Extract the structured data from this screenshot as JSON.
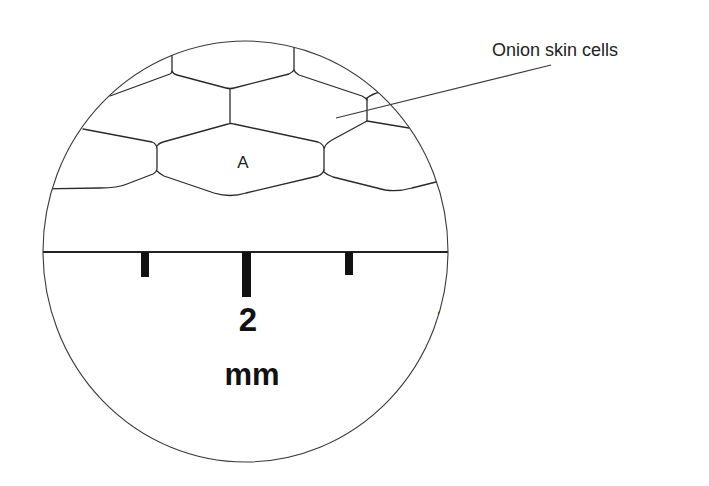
{
  "diagram": {
    "label": "Onion skin cells",
    "cell_label": "A",
    "scale": {
      "numbers": [
        "1",
        "2",
        "3"
      ],
      "unit": "mm"
    },
    "colors": {
      "line": "#2a2a2a",
      "background": "#ffffff"
    }
  }
}
